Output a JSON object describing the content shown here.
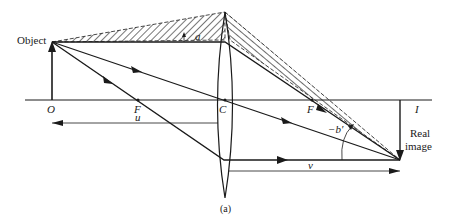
{
  "diagram": {
    "type": "thin-lens ray diagram (real image formation)",
    "caption": "(a)",
    "labels": {
      "object": "Object",
      "origin": "O",
      "focal_left": "F",
      "center": "C",
      "focal_right": "F",
      "image_point": "I",
      "image_line1": "Real",
      "image_line2": "image",
      "object_distance": "u",
      "image_distance": "v",
      "angle_a": "a",
      "angle_b": "−b′"
    },
    "colors": {
      "ink": "#1a1a1a",
      "background": "#ffffff"
    }
  }
}
